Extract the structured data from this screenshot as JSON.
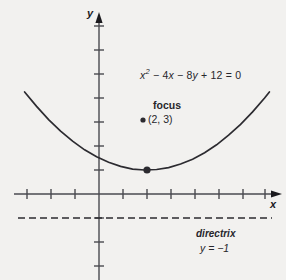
{
  "chart_data": {
    "type": "line",
    "title": "",
    "xlabel": "x",
    "ylabel": "y",
    "grid": false,
    "legend_position": "none",
    "xlim": [
      -3.1,
      7.2
    ],
    "ylim": [
      -3.5,
      7.0
    ],
    "x_tick_spacing": 1,
    "y_tick_spacing": 1,
    "x_ticks": [
      -3,
      -2,
      -1,
      1,
      2,
      3,
      4,
      5,
      6,
      7
    ],
    "y_ticks": [
      -3,
      -2,
      -1,
      1,
      2,
      3,
      4,
      5,
      6,
      7
    ],
    "tick_labels_shown": false,
    "equation": "x^2 - 4x - 8y + 12 = 0",
    "curve": {
      "name": "parabola",
      "form": "y = (x - 2)^2 / 8 + 1",
      "vertex": [
        2,
        1
      ],
      "opens": "up",
      "x_range": [
        -3.1,
        7.1
      ],
      "points": [
        [
          -3.1,
          4.25
        ],
        [
          -2.6,
          3.65
        ],
        [
          -2.1,
          3.1
        ],
        [
          -1.6,
          2.62
        ],
        [
          -1.1,
          2.2
        ],
        [
          -0.6,
          1.84
        ],
        [
          -0.1,
          1.55
        ],
        [
          0.4,
          1.32
        ],
        [
          0.9,
          1.15
        ],
        [
          1.4,
          1.04
        ],
        [
          1.9,
          1.0
        ],
        [
          2.4,
          1.02
        ],
        [
          2.9,
          1.1
        ],
        [
          3.4,
          1.25
        ],
        [
          3.9,
          1.45
        ],
        [
          4.4,
          1.72
        ],
        [
          4.9,
          2.05
        ],
        [
          5.4,
          2.45
        ],
        [
          5.9,
          2.9
        ],
        [
          6.4,
          3.42
        ],
        [
          6.9,
          4.0
        ],
        [
          7.1,
          4.25
        ]
      ]
    },
    "markers": [
      {
        "name": "vertex",
        "point": [
          2,
          1
        ],
        "label": ""
      }
    ],
    "directrix": {
      "y": -1,
      "style": "dashed",
      "label": "directrix",
      "equation": "y = -1"
    },
    "focus": {
      "point": [
        2,
        3
      ],
      "label": "focus",
      "coordinates_text": "(2, 3)"
    }
  },
  "figure": {
    "equation_html_parts": {
      "x": "x",
      "sup2": "2",
      "minus4x": " − 4",
      "x2": "x",
      "minus8y": " − 8",
      "y": "y",
      "tail": " + 12 = 0"
    },
    "equation_text": "x² − 4x − 8y + 12 = 0",
    "focus_label": "focus",
    "focus_coordinates": "(2, 3)",
    "directrix_label": "directrix",
    "directrix_equation": "y = −1",
    "x_axis_label": "x",
    "y_axis_label": "y",
    "colors": {
      "background": "#f2f1ef",
      "axis": "#4a4a50",
      "curve": "#2c2b30",
      "directrix": "#2c2b30",
      "text": "#27262b"
    }
  }
}
